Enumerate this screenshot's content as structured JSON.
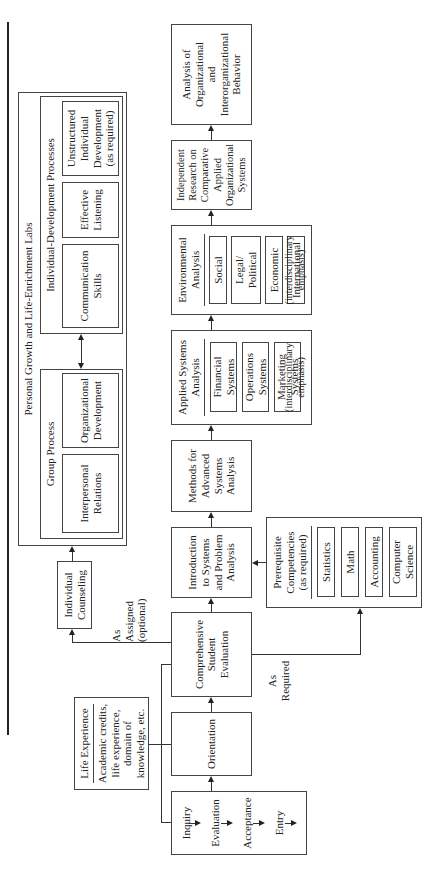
{
  "diagram": {
    "rotation": "-90deg",
    "main_flow": {
      "entry_steps": [
        "Inquiry",
        "Evaluation",
        "Acceptance",
        "Entry"
      ],
      "orientation": "Orientation",
      "cse": "Comprehensive\nStudent\nEvaluation",
      "intro": "Introduction\nto Systems\nand Problem\nAnalysis",
      "methods": "Methods for\nAdvanced\nSystems\nAnalysis",
      "applied": {
        "title": "Applied Systems\nAnalysis",
        "items": [
          "Financial\nSystems",
          "Operations\nSystems",
          "Marketing\nSystems"
        ],
        "note": "(interdisciplinary\nemphasis)"
      },
      "environmental": {
        "title": "Environmental\nAnalysis",
        "items": [
          "Social",
          "Legal/\nPolitical",
          "Economic",
          "International"
        ],
        "note": "(interdisciplinary\nemphasis)"
      },
      "independent": "Independent\nResearch on\nComparative\nApplied\nOrganizational\nSystems",
      "analysis": "Analysis of\nOrganizational\nand\nInterorganizational\nBehavior"
    },
    "life_experience": {
      "title": "Life Experience",
      "body": "Academic credits,\nlife experience,\ndomain of\nknowledge, etc."
    },
    "prerequisite": {
      "title": "Prerequisite\nCompetencies\n(as required)",
      "items": [
        "Statistics",
        "Math",
        "Accounting",
        "Computer\nScience"
      ]
    },
    "counseling": "Individual\nCounseling",
    "labels": {
      "as_assigned": "As\nAssigned\n(optional)",
      "as_required": "As\nRequired"
    },
    "labs": {
      "title": "Personal Growth and Life-Enrichment Labs",
      "group": {
        "title": "Group Process",
        "items": [
          "Interpersonal\nRelations",
          "Organizational\nDevelopment"
        ]
      },
      "individual": {
        "title": "Individual-Development Processes",
        "items": [
          "Communication\nSkills",
          "Effective\nListening",
          "Unstructured\nIndividual\nDevelopment\n(as required)"
        ]
      }
    }
  }
}
